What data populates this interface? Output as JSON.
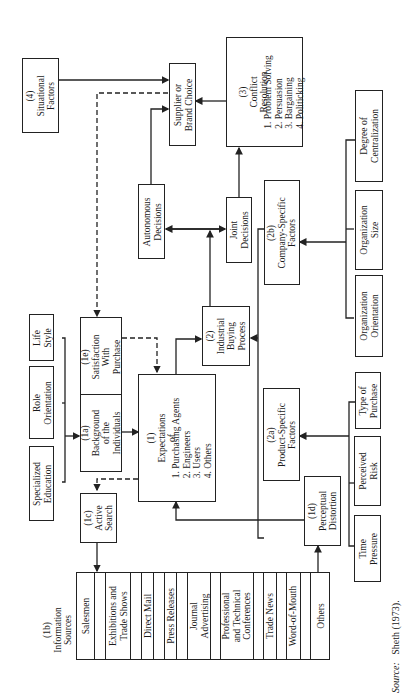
{
  "diagram": {
    "situational": "(4)\nSituational\nFactors",
    "supplier": "Supplier or\nBrand Choice",
    "conflict_title": "(3)\nConflict\nResolution",
    "conflict_items": "1. Problem Solving\n2. Persuasion\n3. Bargaining\n4. Politicking",
    "autonomous": "Autonomous\nDecisions",
    "joint": "Joint\nDecisions",
    "company": "(2b)\nCompany-Specific\nFactors",
    "centralization": "Degree of\nCentralization",
    "org_size": "Organization\nSize",
    "org_orientation": "Organization\nOrientation",
    "life_style": "Life\nStyle",
    "role_orientation": "Role\nOrientation",
    "specialized_education": "Specialized\nEducation",
    "satisfaction": "(1e)\nSatisfaction\nWith\nPurchase",
    "background": "(1a)\nBackground\nof the\nIndividuals",
    "expectations_title": "(1)\nExpectations\nof",
    "expectations_items": "1. Purchasing Agents\n2. Engineers\n3. Users\n4. Others",
    "industrial": "(2)\nIndustrial\nBuying\nProcess",
    "product": "(2a)\nProduct-Specific\nFactors",
    "type_purchase": "Type of\nPurchase",
    "perceived_risk": "Perceived\nRisk",
    "time_pressure": "Time\nPressure",
    "active_search": "(1c)\nActive\nSearch",
    "perceptual": "(1d)\nPerceptual\nDistortion",
    "info_label": "(1b)\nInformation\nSources",
    "info_sources": [
      "Salesmen",
      "Exhibitions and\nTrade Shows",
      "Direct Mail",
      "Press Releases",
      "Journal\nAdvertising",
      "Professional\nand Technical\nConferences",
      "Trade News",
      "Word-of-Mouth",
      "Others"
    ],
    "source_label": "Source:",
    "source_text": "Sheth (1973)."
  }
}
